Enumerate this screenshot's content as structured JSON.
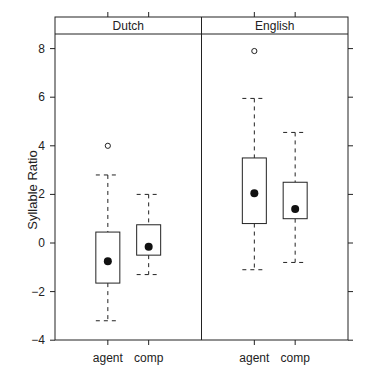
{
  "chart_data": {
    "type": "box",
    "title": "",
    "ylabel": "Syllable Ratio",
    "xlabel": "",
    "ylim": [
      -4,
      8.7
    ],
    "yticks": [
      -4,
      -2,
      0,
      2,
      4,
      6,
      8
    ],
    "grid": false,
    "categories": [
      "agent",
      "comp"
    ],
    "panels": [
      {
        "name": "Dutch",
        "boxes": [
          {
            "category": "agent",
            "whisker_low": -3.2,
            "q1": -1.65,
            "median": -0.75,
            "q3": 0.45,
            "whisker_high": 2.8,
            "outliers": [
              4.0
            ]
          },
          {
            "category": "comp",
            "whisker_low": -1.3,
            "q1": -0.5,
            "median": -0.15,
            "q3": 0.75,
            "whisker_high": 2.0,
            "outliers": []
          }
        ]
      },
      {
        "name": "English",
        "boxes": [
          {
            "category": "agent",
            "whisker_low": -1.1,
            "q1": 0.8,
            "median": 2.05,
            "q3": 3.5,
            "whisker_high": 5.95,
            "outliers": [
              7.9
            ]
          },
          {
            "category": "comp",
            "whisker_low": -0.8,
            "q1": 1.0,
            "median": 1.4,
            "q3": 2.5,
            "whisker_high": 4.55,
            "outliers": []
          }
        ]
      }
    ]
  }
}
